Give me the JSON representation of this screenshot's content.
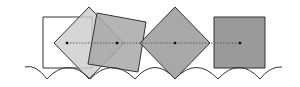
{
  "diagram": {
    "colors": {
      "stroke": "#333333",
      "white_square": "#ffffff",
      "light_diamond": "#cfcfcf",
      "tilted_square": "#a8a8a8",
      "dark_diamond": "#9a9a9a",
      "dark_square": "#888888",
      "center_path": "#555555"
    },
    "shapes": [
      {
        "name": "white-square",
        "type": "square",
        "points": "43,17 92,17 92,68 43,68"
      },
      {
        "name": "light-diamond",
        "type": "diamond",
        "points": "89,7 124,43 89,79 54,43"
      },
      {
        "name": "tilted-square",
        "type": "square",
        "points": "97,13 146,22 138,72 88,64"
      },
      {
        "name": "dark-diamond",
        "type": "diamond",
        "points": "175,7 210,43 175,79 140,43"
      },
      {
        "name": "dark-square",
        "type": "square",
        "points": "214,17 265,17 265,68 214,68"
      }
    ],
    "center_points": [
      {
        "x": 67,
        "y": 43
      },
      {
        "x": 117,
        "y": 43
      },
      {
        "x": 175,
        "y": 43
      },
      {
        "x": 240,
        "y": 43
      }
    ],
    "road_path": "M25,67 Q36,64 47,79 Q68,56 90,79 Q112,56 135,79 Q155,56 175,79 Q196,56 218,79 Q239,56 260,79 Q270,66 282,67"
  }
}
